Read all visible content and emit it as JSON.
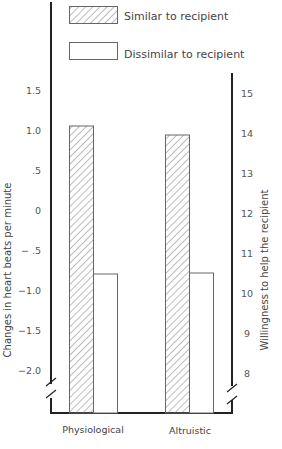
{
  "chart_data": {
    "type": "bar",
    "title": "",
    "categories": [
      "Physiological",
      "Altruistic"
    ],
    "series": [
      {
        "name": "Similar to recipient",
        "pattern": "hatched",
        "values": [
          1.05,
          13.95
        ],
        "axis": [
          "left",
          "right"
        ]
      },
      {
        "name": "Dissimilar to recipient",
        "pattern": "open",
        "values": [
          -0.8,
          10.5
        ],
        "axis": [
          "left",
          "right"
        ]
      }
    ],
    "left_axis": {
      "label": "Changes in heart beats per minute",
      "ticks": [
        "1.5",
        "1.0",
        ".5",
        "0",
        "− .5",
        "−1.0",
        "−1.5",
        "−2.0"
      ],
      "tick_values": [
        1.5,
        1.0,
        0.5,
        0,
        -0.5,
        -1.0,
        -1.5,
        -2.0
      ],
      "applies_to": "Physiological",
      "axis_break": true
    },
    "right_axis": {
      "label": "Willingness to help the recipient",
      "ticks": [
        "15",
        "14",
        "13",
        "12",
        "11",
        "10",
        "9",
        "8"
      ],
      "tick_values": [
        15,
        14,
        13,
        12,
        11,
        10,
        9,
        8
      ],
      "applies_to": "Altruistic",
      "axis_break": true
    },
    "legend": {
      "position": "top",
      "entries": [
        "Similar to recipient",
        "Dissimilar to recipient"
      ]
    },
    "grid": false
  },
  "colors": {
    "axis": "#222222",
    "bar_stroke": "#666666",
    "hatch": "#777777",
    "background": "#ffffff"
  }
}
